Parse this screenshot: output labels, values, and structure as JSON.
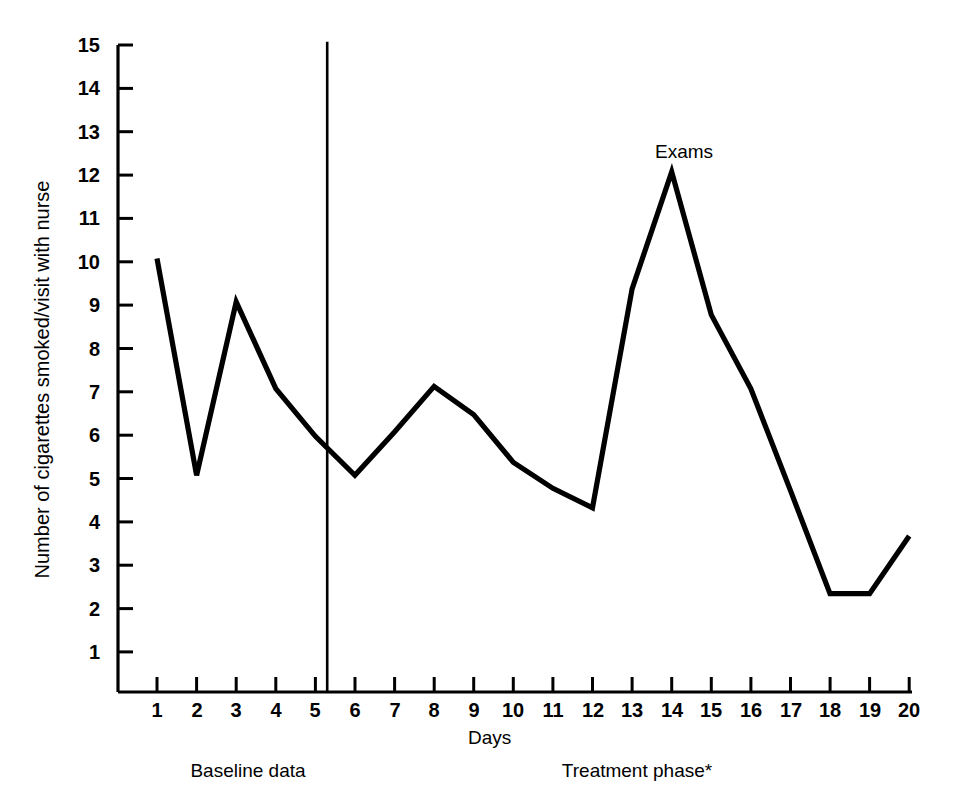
{
  "chart_data": {
    "type": "line",
    "title": "",
    "xlabel": "Days",
    "ylabel": "Number of cigarettes smoked/visit with nurse",
    "x": [
      1,
      2,
      3,
      4,
      5,
      6,
      7,
      8,
      9,
      10,
      11,
      12,
      13,
      14,
      15,
      16,
      17,
      18,
      19,
      20
    ],
    "values": [
      10,
      5,
      9,
      7,
      5.9,
      5,
      6,
      7.05,
      6.4,
      5.3,
      4.7,
      4.25,
      9.3,
      12,
      8.7,
      7,
      4.65,
      2.27,
      2.27,
      3.6
    ],
    "series": [
      {
        "name": "Cigarettes smoked per visit",
        "values": [
          10,
          5,
          9,
          7,
          5.9,
          5,
          6,
          7.05,
          6.4,
          5.3,
          4.7,
          4.25,
          9.3,
          12,
          8.7,
          7,
          4.65,
          2.27,
          2.27,
          3.6
        ]
      }
    ],
    "xlim": [
      1,
      20
    ],
    "ylim": [
      0,
      15
    ],
    "xticks": [
      "1",
      "2",
      "3",
      "4",
      "5",
      "6",
      "7",
      "8",
      "9",
      "10",
      "11",
      "12",
      "13",
      "14",
      "15",
      "16",
      "17",
      "18",
      "19",
      "20"
    ],
    "yticks": [
      "1",
      "2",
      "3",
      "4",
      "5",
      "6",
      "7",
      "8",
      "9",
      "10",
      "11",
      "12",
      "13",
      "14",
      "15"
    ],
    "grid": false,
    "legend": "none",
    "line_color": "#000000",
    "axis_color": "#000000",
    "background_color": "#ffffff",
    "annotations": [
      {
        "name": "exams",
        "text": "Exams",
        "x": 14,
        "y": 13.0
      }
    ],
    "phase_divider": {
      "x": 5.3,
      "y_top": 15,
      "label": "phase-divider"
    },
    "phase_labels": [
      {
        "name": "baseline",
        "text": "Baseline data",
        "x": 3.3
      },
      {
        "name": "treatment",
        "text": "Treatment phase*",
        "x": 13.1
      }
    ]
  }
}
